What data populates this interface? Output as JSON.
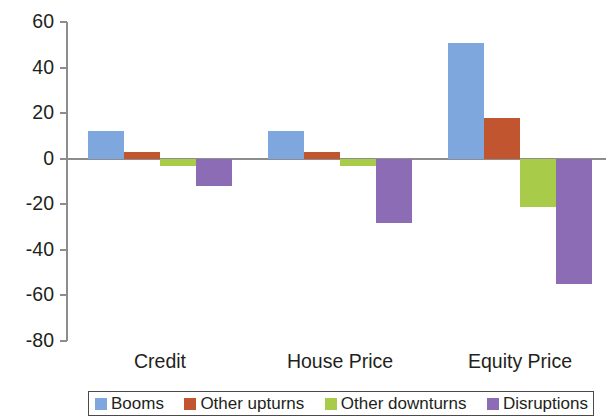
{
  "chart_data": {
    "type": "bar",
    "title": "",
    "subtitle": "",
    "xlabel": "",
    "ylabel": "",
    "categories": [
      "Credit",
      "House Price",
      "Equity Price"
    ],
    "series": [
      {
        "name": "Booms",
        "color": "#7da7dd",
        "values": [
          12,
          12,
          51
        ]
      },
      {
        "name": "Other upturns",
        "color": "#c0552f",
        "values": [
          3,
          3,
          18
        ]
      },
      {
        "name": "Other downturns",
        "color": "#a8cc4a",
        "values": [
          -3,
          -3,
          -21
        ]
      },
      {
        "name": "Disruptions",
        "color": "#8c6cb5",
        "values": [
          -12,
          -28,
          -55
        ]
      }
    ],
    "ylim": [
      -80,
      60
    ],
    "ytick_values": [
      60,
      40,
      20,
      0,
      -20,
      -40,
      -60,
      -80
    ],
    "ytick_labels": [
      "60",
      "40",
      "20",
      "0",
      "-20",
      "-40",
      "-60",
      "-80"
    ],
    "grid": false,
    "legend_position": "bottom"
  },
  "axis": {
    "zero_label": "0",
    "axis_color": "#8d8d8d"
  }
}
